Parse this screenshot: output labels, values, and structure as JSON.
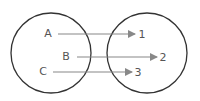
{
  "diagram": {
    "type": "mapping",
    "colors": {
      "circle": "#333333",
      "arrow": "#888888",
      "text": "#555555"
    },
    "domain": {
      "circle": {
        "cx": 51,
        "cy": 53,
        "r": 40
      },
      "elements": [
        {
          "label": "A",
          "x": 48,
          "y": 34
        },
        {
          "label": "B",
          "x": 66,
          "y": 57
        },
        {
          "label": "C",
          "x": 43,
          "y": 72
        }
      ]
    },
    "codomain": {
      "circle": {
        "cx": 147,
        "cy": 53,
        "r": 40
      },
      "elements": [
        {
          "label": "1",
          "x": 142,
          "y": 34
        },
        {
          "label": "2",
          "x": 163,
          "y": 57
        },
        {
          "label": "3",
          "x": 138,
          "y": 72
        }
      ]
    },
    "mappings": [
      {
        "from": "A",
        "to": "1",
        "x1": 58,
        "x2": 135,
        "y": 34
      },
      {
        "from": "B",
        "to": "2",
        "x1": 77,
        "x2": 157,
        "y": 57
      },
      {
        "from": "C",
        "to": "3",
        "x1": 53,
        "x2": 132,
        "y": 72
      }
    ]
  }
}
